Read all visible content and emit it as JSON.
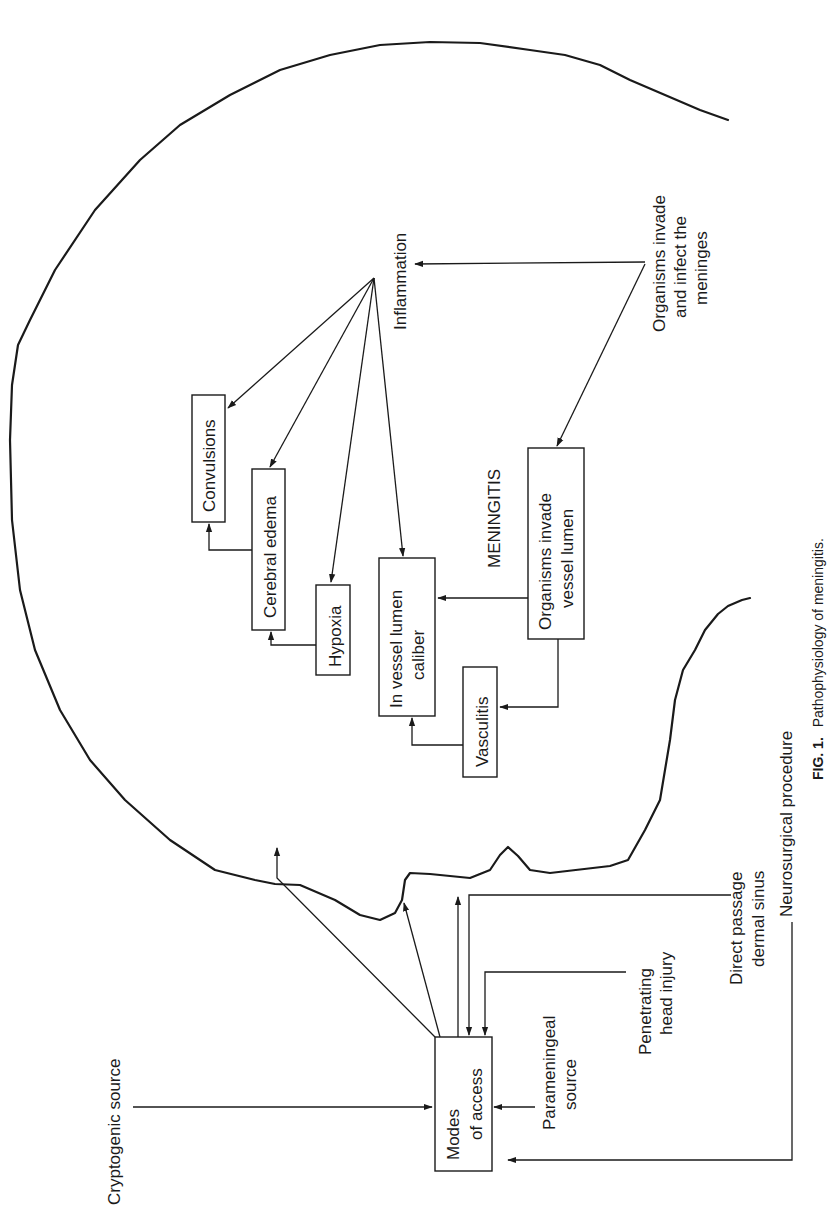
{
  "figure": {
    "orientation": "rotated 90 degrees counter-clockwise",
    "caption_label": "FIG. 1.",
    "caption_text": "Pathophysiology of meningitis.",
    "central_label": "MENINGITIS"
  },
  "nodes": {
    "modes_of_access": {
      "line1": "Modes",
      "line2": "of access"
    },
    "convulsions": {
      "line1": "Convulsions"
    },
    "cerebral_edema": {
      "line1": "Cerebral edema"
    },
    "hypoxia": {
      "line1": "Hypoxia"
    },
    "vessel_lumen_caliber": {
      "line1": "In vessel lumen",
      "line2": "caliber"
    },
    "vasculitis": {
      "line1": "Vasculitis"
    },
    "organisms_invade_vessel": {
      "line1": "Organisms invade",
      "line2": "vessel lumen"
    }
  },
  "labels": {
    "inflammation": "Inflammation",
    "organisms_invade_meninges": {
      "line1": "Organisms invade",
      "line2": "and infect the",
      "line3": "meninges"
    },
    "cryptogenic_source": "Cryptogenic source",
    "parameningeal_source": {
      "line1": "Parameningeal",
      "line2": "source"
    },
    "penetrating_head_injury": {
      "line1": "Penetrating",
      "line2": "head injury"
    },
    "direct_passage": {
      "line1": "Direct passage",
      "line2": "dermal sinus"
    },
    "neurosurgical_procedure": "Neurosurgical procedure"
  },
  "edges": [
    {
      "from": "Organisms invade and infect the meninges",
      "to": "Inflammation"
    },
    {
      "from": "Organisms invade and infect the meninges",
      "to": "Organisms invade vessel lumen"
    },
    {
      "from": "Inflammation",
      "to": "Convulsions"
    },
    {
      "from": "Inflammation",
      "to": "Cerebral edema"
    },
    {
      "from": "Inflammation",
      "to": "Hypoxia"
    },
    {
      "from": "Inflammation",
      "to": "In vessel lumen caliber"
    },
    {
      "from": "Cerebral edema",
      "to": "Convulsions"
    },
    {
      "from": "Hypoxia",
      "to": "Cerebral edema"
    },
    {
      "from": "Organisms invade vessel lumen",
      "to": "In vessel lumen caliber"
    },
    {
      "from": "Organisms invade vessel lumen",
      "to": "Vasculitis"
    },
    {
      "from": "Vasculitis",
      "to": "In vessel lumen caliber"
    },
    {
      "from": "Cryptogenic source",
      "to": "Modes of access"
    },
    {
      "from": "Parameningeal source",
      "to": "Modes of access"
    },
    {
      "from": "Penetrating head injury",
      "to": "Modes of access"
    },
    {
      "from": "Direct passage dermal sinus",
      "to": "Modes of access"
    },
    {
      "from": "Neurosurgical procedure",
      "to": "Modes of access"
    },
    {
      "from": "Modes of access",
      "to": "Meninges (3 arrows to skull outline)"
    }
  ],
  "colors": {
    "ink": "#1a1a1a",
    "background": "#ffffff"
  }
}
